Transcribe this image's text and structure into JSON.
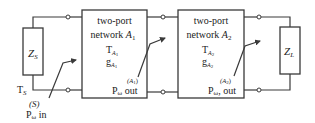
{
  "diagram": {
    "source": {
      "impedance_label": "Z",
      "impedance_sub": "S",
      "temp_label": "T",
      "temp_sub": "S",
      "port_tag": "(S)",
      "power_label": "P",
      "power_sub": "ω",
      "power_suffix": " in"
    },
    "network1": {
      "title_line1": "two-port",
      "title_line2": "network ",
      "name": "A",
      "name_sub": "1",
      "temp_label": "T",
      "temp_sub": "A",
      "temp_subsub": "1",
      "gain_label": "g",
      "gain_sub": "A",
      "gain_subsub": "1",
      "port_tag": "(A",
      "port_tag_sub": "1",
      "port_tag_close": ")",
      "power_label": "P",
      "power_sub": "ω",
      "power_suffix": " out"
    },
    "network2": {
      "title_line1": "two-port",
      "title_line2": "network ",
      "name": "A",
      "name_sub": "2",
      "temp_label": "T",
      "temp_sub": "A",
      "temp_subsub": "2",
      "gain_label": "g",
      "gain_sub": "A",
      "gain_subsub": "2",
      "port_tag": "(A",
      "port_tag_sub": "2",
      "port_tag_close": ")",
      "power_label": "P",
      "power_sub": "ω",
      "power_suffix": ", out"
    },
    "load": {
      "impedance_label": "Z",
      "impedance_sub": "L"
    }
  }
}
